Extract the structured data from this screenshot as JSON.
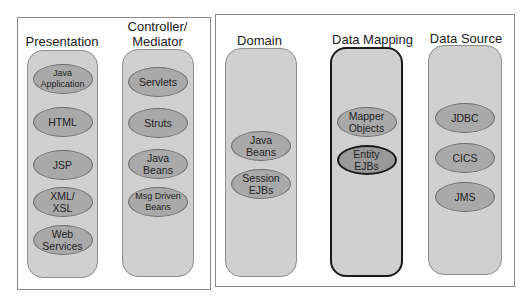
{
  "diagram": {
    "left_group": {
      "columns": [
        {
          "title": "Presentation",
          "items": [
            "Java\nApplication",
            "HTML",
            "JSP",
            "XML/\nXSL",
            "Web\nServices"
          ]
        },
        {
          "title": "Controller/\nMediator",
          "items": [
            "Servlets",
            "Struts",
            "Java\nBeans",
            "Msg Driven\nBeans"
          ]
        }
      ]
    },
    "right_group": {
      "columns": [
        {
          "title": "Domain",
          "items": [
            "Java\nBeans",
            "Session\nEJBs"
          ]
        },
        {
          "title": "Data Mapping",
          "highlighted": true,
          "items": [
            "Mapper\nObjects",
            "Entity\nEJBs"
          ],
          "highlighted_item": "Entity\nEJBs"
        },
        {
          "title": "Data Source",
          "items": [
            "JDBC",
            "CICS",
            "JMS"
          ]
        }
      ]
    },
    "colors": {
      "column_fill": "#d0d0d0",
      "pill_fill": "#a9a9a9",
      "highlight_border": "#1a1a1a",
      "frame_border": "#8a8a8a"
    }
  }
}
